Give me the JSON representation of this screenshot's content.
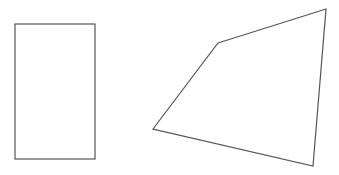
{
  "canvas": {
    "width": 339,
    "height": 175,
    "background": "#ffffff"
  },
  "stroke": {
    "color": "#555555",
    "width": 1.2
  },
  "shapes": [
    {
      "type": "rectangle",
      "name": "rectangle",
      "x": 15,
      "y": 24,
      "width": 80,
      "height": 135
    },
    {
      "type": "quadrilateral",
      "name": "irregular-quadrilateral",
      "points": [
        [
          218,
          43
        ],
        [
          326,
          9
        ],
        [
          313,
          166
        ],
        [
          153,
          129
        ]
      ]
    }
  ]
}
